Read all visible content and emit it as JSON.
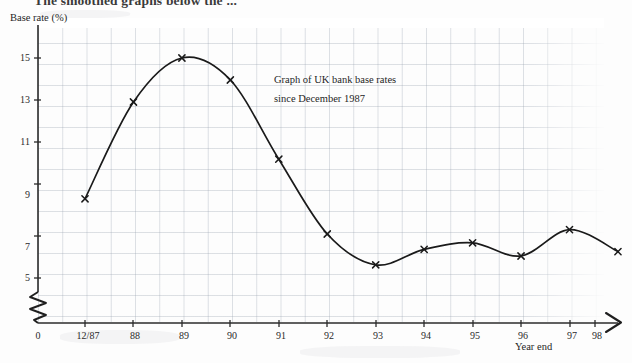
{
  "page": {
    "top_cut_text": "The smoothed graphs below the  ..."
  },
  "chart_data": {
    "type": "line",
    "title": "",
    "annotation_lines": [
      "Graph of UK bank base rates",
      "since December 1987"
    ],
    "xlabel": "Year end",
    "ylabel": "Base rate (%)",
    "categories": [
      "12/87",
      "88",
      "89",
      "90",
      "91",
      "92",
      "93",
      "94",
      "95",
      "96",
      "97",
      "98"
    ],
    "values": [
      8.6,
      13.0,
      15.0,
      14.0,
      10.4,
      7.0,
      5.6,
      6.3,
      6.6,
      6.0,
      7.2,
      6.2
    ],
    "x_tick_labels": [
      "0",
      "12/87",
      "88",
      "89",
      "90",
      "91",
      "92",
      "93",
      "94",
      "95",
      "96",
      "97",
      "98"
    ],
    "y_tick_labels": [
      "5",
      "7",
      "9",
      "11",
      "13",
      "15"
    ],
    "y_tick_values": [
      5,
      7,
      9,
      11,
      13,
      15
    ],
    "ylim": [
      4.6,
      15.6
    ],
    "grid": true,
    "legend": "none",
    "marker": "x",
    "axis_break_x": true,
    "axis_break_y": true,
    "line_color": "#1a1a1a"
  }
}
